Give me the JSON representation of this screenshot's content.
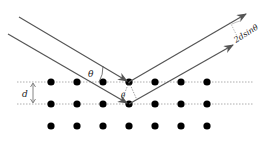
{
  "diagram": {
    "labels": {
      "theta": "θ",
      "theta_prime": "θ",
      "spacing": "d",
      "path_difference": "2dsinθ"
    },
    "lattice": {
      "columns_x": [
        51,
        77,
        103,
        129,
        155,
        181,
        207
      ],
      "rows_y": [
        82,
        104,
        126
      ],
      "dotted_planes_y": [
        82,
        104
      ],
      "plane_x_range": [
        17,
        253
      ]
    },
    "rays": {
      "incident": [
        {
          "from": [
            19,
            17
          ],
          "to": [
            129,
            82
          ]
        },
        {
          "from": [
            8,
            34
          ],
          "to": [
            129,
            104
          ]
        }
      ],
      "reflected": [
        {
          "from": [
            129,
            82
          ],
          "to": [
            246,
            14
          ]
        },
        {
          "from": [
            129,
            104
          ],
          "to": [
            233,
            45
          ]
        }
      ]
    },
    "colors": {
      "ray": "#555555",
      "dot": "#000000",
      "plane": "#999999",
      "label": "#222222"
    }
  }
}
